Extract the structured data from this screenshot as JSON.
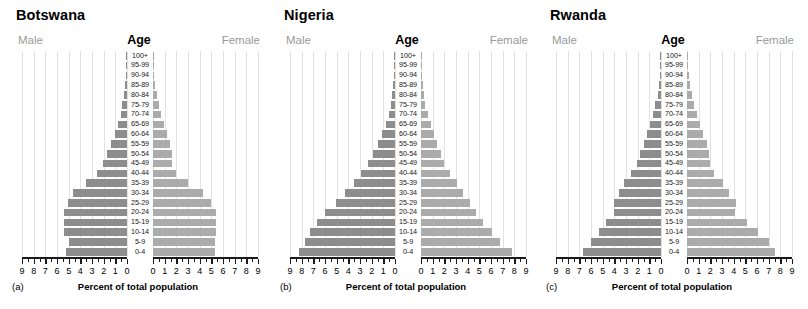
{
  "figure": {
    "axis_title": "Percent of total population",
    "male_label": "Male",
    "female_label": "Female",
    "age_header": "Age",
    "colors": {
      "male_bar": "#8d8d8d",
      "female_bar": "#ababab",
      "gridline": "#e2e2e2",
      "axis": "#1a1a1a",
      "sex_label": "#9a9a9a"
    },
    "age_groups": [
      "100+",
      "95-99",
      "90-94",
      "85-89",
      "80-84",
      "75-79",
      "70-74",
      "65-69",
      "60-64",
      "55-59",
      "50-54",
      "45-49",
      "40-44",
      "35-39",
      "30-34",
      "25-29",
      "20-24",
      "15-19",
      "10-14",
      "5-9",
      "0-4"
    ],
    "x_ticks_left": [
      "9",
      "8",
      "7",
      "6",
      "5",
      "4",
      "3",
      "2",
      "1",
      "0"
    ],
    "x_ticks_right": [
      "0",
      "1",
      "2",
      "3",
      "4",
      "5",
      "6",
      "7",
      "8",
      "9"
    ],
    "x_max": 9
  },
  "panels": [
    {
      "letter": "(a)",
      "title": "Botswana",
      "chart_data": {
        "type": "bar",
        "title": "Botswana",
        "xlabel": "Percent of total population",
        "ylabel": "Age",
        "xlim": [
          0,
          9
        ],
        "grid": true,
        "categories": [
          "100+",
          "95-99",
          "90-94",
          "85-89",
          "80-84",
          "75-79",
          "70-74",
          "65-69",
          "60-64",
          "55-59",
          "50-54",
          "45-49",
          "40-44",
          "35-39",
          "30-34",
          "25-29",
          "20-24",
          "15-19",
          "10-14",
          "5-9",
          "0-4"
        ],
        "series": [
          {
            "name": "Male",
            "values": [
              0.02,
              0.04,
              0.08,
              0.15,
              0.25,
              0.4,
              0.55,
              0.75,
              1.0,
              1.35,
              1.7,
              2.1,
              2.6,
              3.5,
              4.6,
              5.1,
              5.4,
              5.4,
              5.4,
              5.0,
              5.2
            ]
          },
          {
            "name": "Female",
            "values": [
              0.03,
              0.06,
              0.12,
              0.2,
              0.35,
              0.5,
              0.7,
              0.95,
              1.2,
              1.45,
              1.6,
              1.6,
              2.0,
              3.0,
              4.3,
              5.0,
              5.4,
              5.4,
              5.4,
              5.3,
              5.3
            ]
          }
        ]
      }
    },
    {
      "letter": "(b)",
      "title": "Nigeria",
      "chart_data": {
        "type": "bar",
        "title": "Nigeria",
        "xlabel": "Percent of total population",
        "ylabel": "Age",
        "xlim": [
          0,
          9
        ],
        "grid": true,
        "categories": [
          "100+",
          "95-99",
          "90-94",
          "85-89",
          "80-84",
          "75-79",
          "70-74",
          "65-69",
          "60-64",
          "55-59",
          "50-54",
          "45-49",
          "40-44",
          "35-39",
          "30-34",
          "25-29",
          "20-24",
          "15-19",
          "10-14",
          "5-9",
          "0-4"
        ],
        "series": [
          {
            "name": "Male",
            "values": [
              0.01,
              0.03,
              0.07,
              0.13,
              0.22,
              0.35,
              0.55,
              0.8,
              1.1,
              1.45,
              1.85,
              2.3,
              2.9,
              3.55,
              4.3,
              5.1,
              6.0,
              6.7,
              7.3,
              7.7,
              8.2
            ]
          },
          {
            "name": "Female",
            "values": [
              0.01,
              0.03,
              0.07,
              0.13,
              0.22,
              0.38,
              0.6,
              0.85,
              1.1,
              1.4,
              1.7,
              2.0,
              2.5,
              3.1,
              3.6,
              4.2,
              4.7,
              5.3,
              6.1,
              6.8,
              7.8
            ]
          }
        ]
      }
    },
    {
      "letter": "(c)",
      "title": "Rwanda",
      "chart_data": {
        "type": "bar",
        "title": "Rwanda",
        "xlabel": "Percent of total population",
        "ylabel": "Age",
        "xlim": [
          0,
          9
        ],
        "grid": true,
        "categories": [
          "100+",
          "95-99",
          "90-94",
          "85-89",
          "80-84",
          "75-79",
          "70-74",
          "65-69",
          "60-64",
          "55-59",
          "50-54",
          "45-49",
          "40-44",
          "35-39",
          "30-34",
          "25-29",
          "20-24",
          "15-19",
          "10-14",
          "5-9",
          "0-4"
        ],
        "series": [
          {
            "name": "Male",
            "values": [
              0.02,
              0.05,
              0.1,
              0.18,
              0.3,
              0.5,
              0.7,
              0.95,
              1.2,
              1.5,
              1.8,
              2.1,
              2.6,
              3.2,
              3.6,
              4.0,
              4.0,
              4.7,
              5.3,
              6.0,
              6.7
            ]
          },
          {
            "name": "Female",
            "values": [
              0.03,
              0.07,
              0.13,
              0.25,
              0.4,
              0.6,
              0.85,
              1.15,
              1.4,
              1.7,
              1.9,
              2.0,
              2.3,
              3.1,
              3.6,
              4.2,
              4.1,
              5.1,
              6.1,
              7.0,
              7.5
            ]
          }
        ]
      }
    }
  ]
}
